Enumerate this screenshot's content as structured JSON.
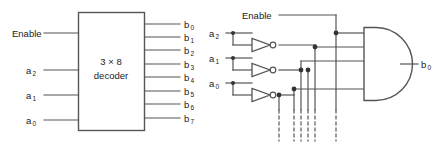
{
  "figure": {
    "background_color": "#ffffff",
    "line_color": "#555555",
    "text_color": "#1a1a1a",
    "width": 442,
    "height": 147
  },
  "left_diagram": {
    "name": "3x8-decoder-block-symbol",
    "block": {
      "line1": "3 × 8",
      "line2": "decoder"
    },
    "inputs": [
      {
        "label": "Enable",
        "base": "Enable",
        "sub": "",
        "y": 33
      },
      {
        "label": "a2",
        "base": "a",
        "sub": "2",
        "y": 70
      },
      {
        "label": "a1",
        "base": "a",
        "sub": "1",
        "y": 95
      },
      {
        "label": "a0",
        "base": "a",
        "sub": "0",
        "y": 120
      }
    ],
    "outputs": [
      {
        "label": "b0",
        "base": "b",
        "sub": "0",
        "y": 24
      },
      {
        "label": "b1",
        "base": "b",
        "sub": "1",
        "y": 37
      },
      {
        "label": "b2",
        "base": "b",
        "sub": "2",
        "y": 50
      },
      {
        "label": "b3",
        "base": "b",
        "sub": "3",
        "y": 64
      },
      {
        "label": "b4",
        "base": "b",
        "sub": "4",
        "y": 77
      },
      {
        "label": "b5",
        "base": "b",
        "sub": "5",
        "y": 91
      },
      {
        "label": "b6",
        "base": "b",
        "sub": "6",
        "y": 104
      },
      {
        "label": "b7",
        "base": "b",
        "sub": "7",
        "y": 118
      }
    ]
  },
  "right_diagram": {
    "name": "decoder-internal-gate-logic",
    "inputs": [
      {
        "label": "Enable",
        "base": "Enable",
        "sub": "",
        "y": 15
      },
      {
        "label": "a2",
        "base": "a",
        "sub": "2",
        "y": 33
      },
      {
        "label": "a1",
        "base": "a",
        "sub": "1",
        "y": 58
      },
      {
        "label": "a0",
        "base": "a",
        "sub": "0",
        "y": 83
      }
    ],
    "inverters": [
      {
        "name": "inverter-a2",
        "input": "a2",
        "output": "a2-bar"
      },
      {
        "name": "inverter-a1",
        "input": "a1",
        "output": "a1-bar"
      },
      {
        "name": "inverter-a0",
        "input": "a0",
        "output": "a0-bar"
      }
    ],
    "gate": {
      "type": "AND",
      "name": "and-gate-b0",
      "inputs": 4,
      "output": {
        "label": "b0",
        "base": "b",
        "sub": "0"
      }
    },
    "continuation": {
      "note": "dashed vertical continuation lines to further AND gates",
      "count": 6
    }
  }
}
